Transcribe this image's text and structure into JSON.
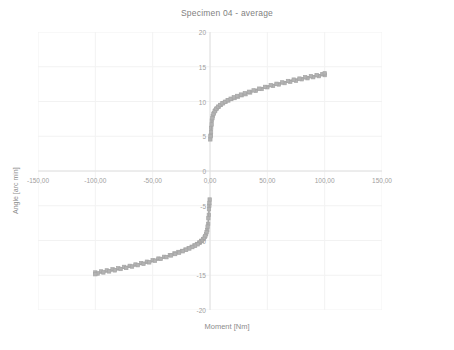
{
  "chart_data": {
    "type": "line",
    "title": "Specimen 04 - average",
    "xlabel": "Moment [Nm]",
    "ylabel": "Angle [arc min]",
    "xlim": [
      -150,
      150
    ],
    "ylim": [
      -20,
      20
    ],
    "xticks": [
      "-150,00",
      "-100,00",
      "-50,00",
      "0,00",
      "50,00",
      "100,00",
      "150,00"
    ],
    "xtick_values": [
      -150,
      -100,
      -50,
      0,
      50,
      100,
      150
    ],
    "yticks": [
      "20",
      "15",
      "10",
      "5",
      "0",
      "-5",
      "-10",
      "-15",
      "-20"
    ],
    "ytick_values": [
      20,
      15,
      10,
      5,
      0,
      -5,
      -10,
      -15,
      -20
    ],
    "grid": true,
    "legend": "none",
    "series_color": "#a6a6a6",
    "marker": "square",
    "series": [
      {
        "name": "loading",
        "x": [
          0.3,
          0.6,
          1.0,
          1.6,
          2.4,
          3.4,
          4.6,
          6.0,
          7.6,
          9.4,
          11.4,
          13.6,
          16.0,
          18.6,
          21.4,
          24.4,
          27.6,
          31.0,
          35.0,
          40.0,
          45.0,
          50.0,
          55.0,
          60.0,
          65.0,
          70.0,
          75.0,
          80.0,
          85.0,
          90.0,
          95.0,
          100.0
        ],
        "y": [
          4.55,
          5.1,
          6.2,
          7.25,
          7.9,
          8.35,
          8.7,
          9.0,
          9.25,
          9.5,
          9.75,
          9.95,
          10.15,
          10.35,
          10.5,
          10.7,
          10.9,
          11.05,
          11.3,
          11.55,
          11.8,
          12.05,
          12.25,
          12.45,
          12.65,
          12.85,
          13.0,
          13.2,
          13.35,
          13.5,
          13.65,
          13.8
        ]
      },
      {
        "name": "unloading",
        "x": [
          0.5,
          0.9,
          1.4,
          2.1,
          3.0,
          4.1,
          5.4,
          7.0,
          8.8,
          10.8,
          13.0,
          15.4,
          18.0,
          20.8,
          23.8,
          27.0,
          30.4,
          34.0,
          38.0,
          43.0,
          48.0,
          53.0,
          58.0,
          63.0,
          68.0,
          73.0,
          78.0,
          83.0,
          88.0,
          93.0,
          98.0,
          100.0
        ],
        "y": [
          5.0,
          5.6,
          6.7,
          7.6,
          8.2,
          8.6,
          8.95,
          9.25,
          9.5,
          9.75,
          9.95,
          10.2,
          10.4,
          10.6,
          10.8,
          11.0,
          11.2,
          11.4,
          11.6,
          11.85,
          12.1,
          12.35,
          12.55,
          12.75,
          12.95,
          13.15,
          13.3,
          13.5,
          13.65,
          13.8,
          13.95,
          14.05
        ]
      },
      {
        "name": "loading-negative",
        "x": [
          -0.3,
          -0.6,
          -1.0,
          -1.6,
          -2.4,
          -3.4,
          -4.6,
          -6.0,
          -7.6,
          -9.4,
          -11.4,
          -13.6,
          -16.0,
          -18.6,
          -21.4,
          -24.4,
          -27.6,
          -31.0,
          -35.0,
          -40.0,
          -45.0,
          -50.0,
          -55.0,
          -60.0,
          -65.0,
          -70.0,
          -75.0,
          -80.0,
          -85.0,
          -90.0,
          -95.0,
          -100.0
        ],
        "y": [
          -4.1,
          -5.0,
          -6.3,
          -7.6,
          -8.5,
          -9.1,
          -9.5,
          -9.8,
          -10.05,
          -10.3,
          -10.5,
          -10.7,
          -10.9,
          -11.1,
          -11.3,
          -11.5,
          -11.65,
          -11.85,
          -12.1,
          -12.35,
          -12.6,
          -12.85,
          -13.05,
          -13.25,
          -13.45,
          -13.65,
          -13.8,
          -14.0,
          -14.15,
          -14.3,
          -14.45,
          -14.6
        ]
      },
      {
        "name": "unloading-negative",
        "x": [
          -0.5,
          -0.9,
          -1.4,
          -2.1,
          -3.0,
          -4.1,
          -5.4,
          -7.0,
          -8.8,
          -10.8,
          -13.0,
          -15.4,
          -18.0,
          -20.8,
          -23.8,
          -27.0,
          -30.4,
          -34.0,
          -38.0,
          -43.0,
          -48.0,
          -53.0,
          -58.0,
          -63.0,
          -68.0,
          -73.0,
          -78.0,
          -83.0,
          -88.0,
          -93.0,
          -98.0,
          -100.0
        ],
        "y": [
          -4.6,
          -5.5,
          -6.8,
          -8.0,
          -8.8,
          -9.35,
          -9.75,
          -10.05,
          -10.3,
          -10.55,
          -10.75,
          -10.95,
          -11.15,
          -11.35,
          -11.55,
          -11.75,
          -11.95,
          -12.15,
          -12.4,
          -12.65,
          -12.9,
          -13.15,
          -13.35,
          -13.55,
          -13.75,
          -13.95,
          -14.1,
          -14.3,
          -14.45,
          -14.6,
          -14.75,
          -14.85
        ]
      }
    ]
  }
}
